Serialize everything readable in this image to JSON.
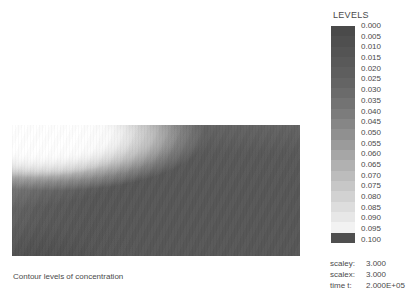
{
  "caption": "Contour levels of concentration",
  "legend": {
    "title": "LEVELS",
    "levels": [
      "0.000",
      "0.005",
      "0.010",
      "0.015",
      "0.020",
      "0.025",
      "0.030",
      "0.035",
      "0.040",
      "0.045",
      "0.050",
      "0.055",
      "0.060",
      "0.065",
      "0.070",
      "0.075",
      "0.080",
      "0.085",
      "0.090",
      "0.095",
      "0.100"
    ],
    "band_colors": [
      "#4a4a4a",
      "#4f4f4f",
      "#545454",
      "#595959",
      "#5e5e5e",
      "#646464",
      "#6b6b6b",
      "#737373",
      "#7c7c7c",
      "#868686",
      "#909090",
      "#9b9b9b",
      "#a6a6a6",
      "#b1b1b1",
      "#bcbcbc",
      "#c7c7c7",
      "#d2d2d2",
      "#dddddd",
      "#e7e7e7",
      "#f2f2f2",
      "#4f4f4f"
    ]
  },
  "info": {
    "scaley_label": "scaley:",
    "scaley_value": "3.000",
    "scalex_label": "scalex:",
    "scalex_value": "3.000",
    "time_label": "time t:",
    "time_value": "2.000E+05"
  },
  "chart_data": {
    "type": "heatmap",
    "title": "Contour levels of concentration",
    "colormap": "grayscale",
    "colorbar_title": "LEVELS",
    "levels": [
      0.0,
      0.005,
      0.01,
      0.015,
      0.02,
      0.025,
      0.03,
      0.035,
      0.04,
      0.045,
      0.05,
      0.055,
      0.06,
      0.065,
      0.07,
      0.075,
      0.08,
      0.085,
      0.09,
      0.095,
      0.1
    ],
    "zlim": [
      0.0,
      0.1
    ],
    "level_step": 0.005,
    "xlabel": "",
    "ylabel": "",
    "grid": false,
    "legend_position": "right",
    "annotations": {
      "scaley": 3.0,
      "scalex": 3.0,
      "time_t": 200000.0
    },
    "field_description": "Rectangular 2D concentration field; high-concentration bright plume anchored at the upper-left corner, spreading as a curved lobe toward the right and downward, decaying to a uniform low background level across the remainder of the domain.",
    "domain_aspect": "288x131 px plot area, wide rectangle"
  }
}
